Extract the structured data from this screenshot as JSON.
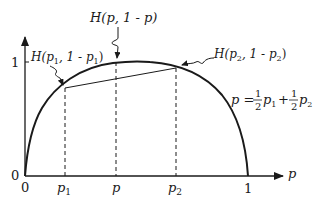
{
  "diagram": {
    "axes": {
      "x_label": "p",
      "y_tick_1": "1",
      "y_tick_0": "0",
      "x_tick_0": "0",
      "x_tick_1": "1"
    },
    "x_ticks": [
      {
        "name": "p1",
        "base": "p",
        "sub": "1"
      },
      {
        "name": "p",
        "base": "p",
        "sub": ""
      },
      {
        "name": "p2",
        "base": "p",
        "sub": "2"
      }
    ],
    "annotations": {
      "h_p": {
        "prefix": "H",
        "text": "(p, 1 - p)"
      },
      "h_p1": {
        "prefix": "H",
        "open": "(p",
        "sub": "1",
        "mid": ", 1 - p",
        "sub2": "1",
        "close": ")"
      },
      "h_p2": {
        "prefix": "H",
        "open": "(p",
        "sub": "2",
        "mid": ", 1 - p",
        "sub2": "2",
        "close": ")"
      }
    },
    "formula": {
      "lhs": "p =",
      "frac1_num": "1",
      "frac1_den": "2",
      "term1": "p",
      "term1_sub": "1",
      "plus": "+",
      "frac2_num": "1",
      "frac2_den": "2",
      "term2": "p",
      "term2_sub": "2"
    },
    "colors": {
      "stroke": "#1a1a1a",
      "background": "#ffffff"
    }
  }
}
